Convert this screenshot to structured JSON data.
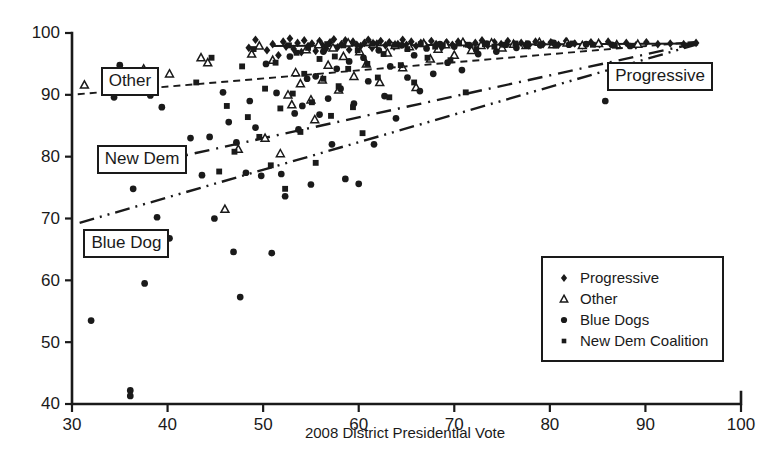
{
  "chart_data": {
    "type": "scatter",
    "title": "",
    "xlabel": "2008 District Presidential Vote",
    "ylabel": "",
    "xlim": [
      30,
      100
    ],
    "ylim": [
      40,
      100
    ],
    "xticks": [
      30,
      40,
      50,
      60,
      70,
      80,
      90,
      100
    ],
    "yticks": [
      40,
      50,
      60,
      70,
      80,
      90,
      100
    ],
    "grid": false,
    "legend_position": "lower-right",
    "series": [
      {
        "name": "Progressive",
        "marker": "diamond",
        "points": [
          [
            48.5,
            97.6
          ],
          [
            49.2,
            98.9
          ],
          [
            50.4,
            97.2
          ],
          [
            51.0,
            98.2
          ],
          [
            51.6,
            96.4
          ],
          [
            52.1,
            98.6
          ],
          [
            52.4,
            97.8
          ],
          [
            52.8,
            99.1
          ],
          [
            53.2,
            97.4
          ],
          [
            53.6,
            98.4
          ],
          [
            54.0,
            96.9
          ],
          [
            54.3,
            98.8
          ],
          [
            54.7,
            97.9
          ],
          [
            55.1,
            98.3
          ],
          [
            55.5,
            97.1
          ],
          [
            55.9,
            98.7
          ],
          [
            56.2,
            98.0
          ],
          [
            56.6,
            97.5
          ],
          [
            57.0,
            98.5
          ],
          [
            57.4,
            99.0
          ],
          [
            57.8,
            97.7
          ],
          [
            58.2,
            98.2
          ],
          [
            58.6,
            98.8
          ],
          [
            59.0,
            97.3
          ],
          [
            59.4,
            98.6
          ],
          [
            59.8,
            98.1
          ],
          [
            60.2,
            97.9
          ],
          [
            60.6,
            98.4
          ],
          [
            61.0,
            98.9
          ],
          [
            61.4,
            97.6
          ],
          [
            61.9,
            98.3
          ],
          [
            62.3,
            98.7
          ],
          [
            62.8,
            98.0
          ],
          [
            63.2,
            98.5
          ],
          [
            63.7,
            97.8
          ],
          [
            64.1,
            98.2
          ],
          [
            64.6,
            98.9
          ],
          [
            65.0,
            98.1
          ],
          [
            65.5,
            98.6
          ],
          [
            66.0,
            97.9
          ],
          [
            66.5,
            98.4
          ],
          [
            67.0,
            98.0
          ],
          [
            67.6,
            98.7
          ],
          [
            68.1,
            98.2
          ],
          [
            68.7,
            97.7
          ],
          [
            69.2,
            98.5
          ],
          [
            69.8,
            98.1
          ],
          [
            70.4,
            98.6
          ],
          [
            71.0,
            98.3
          ],
          [
            71.6,
            97.9
          ],
          [
            72.2,
            98.4
          ],
          [
            72.9,
            98.8
          ],
          [
            73.5,
            98.0
          ],
          [
            74.2,
            98.5
          ],
          [
            74.9,
            98.2
          ],
          [
            75.6,
            98.7
          ],
          [
            76.3,
            98.1
          ],
          [
            77.0,
            98.4
          ],
          [
            77.8,
            98.0
          ],
          [
            78.5,
            98.6
          ],
          [
            79.3,
            98.2
          ],
          [
            80.1,
            98.5
          ],
          [
            80.9,
            98.1
          ],
          [
            81.7,
            98.7
          ],
          [
            82.6,
            98.3
          ],
          [
            83.4,
            98.0
          ],
          [
            84.3,
            98.5
          ],
          [
            85.2,
            98.2
          ],
          [
            86.1,
            98.6
          ],
          [
            87.0,
            98.1
          ],
          [
            88.0,
            98.4
          ],
          [
            89.0,
            98.0
          ],
          [
            90.1,
            98.5
          ],
          [
            91.3,
            98.2
          ],
          [
            92.6,
            98.3
          ],
          [
            94.0,
            98.2
          ],
          [
            95.3,
            98.4
          ]
        ]
      },
      {
        "name": "Other",
        "marker": "triangle-open",
        "points": [
          [
            31.3,
            91.6
          ],
          [
            37.5,
            94.2
          ],
          [
            40.2,
            93.4
          ],
          [
            43.5,
            96.0
          ],
          [
            44.2,
            95.2
          ],
          [
            46.0,
            71.5
          ],
          [
            47.4,
            81.2
          ],
          [
            48.8,
            96.6
          ],
          [
            49.6,
            97.9
          ],
          [
            50.2,
            83.0
          ],
          [
            51.0,
            95.6
          ],
          [
            51.8,
            80.5
          ],
          [
            52.6,
            90.0
          ],
          [
            53.0,
            88.4
          ],
          [
            53.4,
            93.6
          ],
          [
            53.9,
            91.8
          ],
          [
            54.5,
            97.3
          ],
          [
            55.0,
            89.2
          ],
          [
            55.4,
            86.0
          ],
          [
            55.8,
            98.1
          ],
          [
            56.2,
            92.4
          ],
          [
            56.8,
            94.8
          ],
          [
            57.3,
            97.6
          ],
          [
            57.9,
            90.8
          ],
          [
            58.4,
            96.2
          ],
          [
            58.9,
            98.4
          ],
          [
            59.5,
            93.0
          ],
          [
            60.1,
            97.0
          ],
          [
            60.8,
            95.0
          ],
          [
            61.5,
            98.2
          ],
          [
            62.2,
            92.0
          ],
          [
            63.0,
            96.8
          ],
          [
            63.8,
            98.0
          ],
          [
            64.6,
            94.4
          ],
          [
            65.3,
            97.8
          ],
          [
            66.0,
            91.2
          ],
          [
            66.8,
            98.3
          ],
          [
            67.5,
            95.8
          ],
          [
            68.3,
            97.4
          ],
          [
            69.1,
            98.1
          ],
          [
            70.0,
            96.4
          ],
          [
            70.9,
            98.5
          ],
          [
            71.8,
            97.2
          ],
          [
            72.8,
            98.0
          ],
          [
            73.9,
            98.4
          ],
          [
            75.0,
            97.6
          ],
          [
            76.2,
            98.2
          ],
          [
            77.5,
            98.0
          ],
          [
            78.9,
            98.5
          ],
          [
            80.3,
            98.1
          ],
          [
            81.8,
            98.4
          ],
          [
            83.4,
            98.0
          ],
          [
            85.1,
            98.3
          ],
          [
            87.0,
            98.1
          ],
          [
            89.2,
            98.2
          ]
        ]
      },
      {
        "name": "Blue Dogs",
        "marker": "circle",
        "points": [
          [
            32.0,
            53.5
          ],
          [
            34.4,
            89.6
          ],
          [
            35.0,
            94.8
          ],
          [
            36.1,
            42.2
          ],
          [
            36.1,
            41.3
          ],
          [
            36.4,
            74.8
          ],
          [
            37.6,
            59.5
          ],
          [
            38.2,
            89.9
          ],
          [
            38.9,
            70.2
          ],
          [
            39.4,
            88.0
          ],
          [
            40.2,
            66.8
          ],
          [
            42.4,
            83.0
          ],
          [
            43.6,
            77.0
          ],
          [
            44.4,
            83.2
          ],
          [
            44.9,
            70.0
          ],
          [
            45.8,
            90.4
          ],
          [
            46.4,
            85.6
          ],
          [
            46.9,
            64.6
          ],
          [
            47.2,
            82.3
          ],
          [
            47.6,
            57.3
          ],
          [
            48.2,
            77.4
          ],
          [
            48.6,
            89.0
          ],
          [
            49.2,
            84.7
          ],
          [
            49.8,
            76.9
          ],
          [
            50.3,
            95.0
          ],
          [
            50.9,
            64.4
          ],
          [
            51.4,
            90.3
          ],
          [
            51.9,
            77.2
          ],
          [
            52.3,
            73.6
          ],
          [
            52.8,
            96.2
          ],
          [
            53.3,
            87.0
          ],
          [
            53.7,
            84.4
          ],
          [
            54.1,
            88.2
          ],
          [
            54.6,
            92.6
          ],
          [
            55.0,
            75.5
          ],
          [
            55.5,
            93.0
          ],
          [
            55.9,
            86.8
          ],
          [
            56.3,
            97.0
          ],
          [
            56.8,
            89.4
          ],
          [
            57.2,
            82.0
          ],
          [
            57.7,
            94.2
          ],
          [
            58.1,
            91.0
          ],
          [
            58.6,
            76.4
          ],
          [
            59.0,
            95.4
          ],
          [
            59.5,
            88.6
          ],
          [
            60.0,
            75.6
          ],
          [
            60.5,
            96.0
          ],
          [
            61.0,
            92.2
          ],
          [
            61.6,
            82.0
          ],
          [
            62.1,
            97.2
          ],
          [
            62.7,
            89.8
          ],
          [
            63.3,
            94.6
          ],
          [
            63.9,
            86.2
          ],
          [
            64.5,
            98.0
          ],
          [
            65.1,
            92.8
          ],
          [
            65.8,
            96.4
          ],
          [
            66.4,
            90.6
          ],
          [
            67.1,
            97.5
          ],
          [
            67.8,
            93.4
          ],
          [
            68.5,
            98.2
          ],
          [
            69.3,
            95.2
          ],
          [
            70.0,
            97.8
          ],
          [
            70.8,
            94.0
          ],
          [
            71.6,
            98.0
          ],
          [
            72.5,
            96.6
          ],
          [
            73.4,
            98.3
          ],
          [
            74.4,
            97.0
          ],
          [
            75.4,
            98.1
          ],
          [
            76.5,
            97.6
          ],
          [
            77.7,
            98.3
          ],
          [
            79.0,
            98.0
          ],
          [
            80.4,
            98.4
          ],
          [
            82.0,
            98.1
          ],
          [
            83.8,
            98.2
          ],
          [
            85.8,
            89.0
          ],
          [
            86.5,
            98.1
          ],
          [
            88.4,
            97.9
          ]
        ]
      },
      {
        "name": "New Dem Coalition",
        "marker": "square",
        "points": [
          [
            43.0,
            92.0
          ],
          [
            44.6,
            96.0
          ],
          [
            45.4,
            77.6
          ],
          [
            46.2,
            88.2
          ],
          [
            47.0,
            80.8
          ],
          [
            47.8,
            94.6
          ],
          [
            48.4,
            86.4
          ],
          [
            49.0,
            97.4
          ],
          [
            49.6,
            83.2
          ],
          [
            50.2,
            91.0
          ],
          [
            50.8,
            78.6
          ],
          [
            51.3,
            95.2
          ],
          [
            51.8,
            87.8
          ],
          [
            52.3,
            74.8
          ],
          [
            52.7,
            98.0
          ],
          [
            53.1,
            90.2
          ],
          [
            53.5,
            96.8
          ],
          [
            53.9,
            84.0
          ],
          [
            54.3,
            93.4
          ],
          [
            54.7,
            97.6
          ],
          [
            55.1,
            88.8
          ],
          [
            55.5,
            79.0
          ],
          [
            55.9,
            95.8
          ],
          [
            56.3,
            92.6
          ],
          [
            56.7,
            98.2
          ],
          [
            57.1,
            86.6
          ],
          [
            57.5,
            96.2
          ],
          [
            57.9,
            91.4
          ],
          [
            58.4,
            98.0
          ],
          [
            58.9,
            94.2
          ],
          [
            59.4,
            88.0
          ],
          [
            59.9,
            97.2
          ],
          [
            60.4,
            83.8
          ],
          [
            60.9,
            95.0
          ],
          [
            61.4,
            98.3
          ],
          [
            62.0,
            92.8
          ],
          [
            62.6,
            96.6
          ],
          [
            63.2,
            89.6
          ],
          [
            63.8,
            98.1
          ],
          [
            64.4,
            94.8
          ],
          [
            65.1,
            97.4
          ],
          [
            65.8,
            92.0
          ],
          [
            66.5,
            98.2
          ],
          [
            67.2,
            96.0
          ],
          [
            68.0,
            97.8
          ],
          [
            68.8,
            98.0
          ],
          [
            69.6,
            95.6
          ],
          [
            70.5,
            98.3
          ],
          [
            71.2,
            90.4
          ],
          [
            71.4,
            98.1
          ],
          [
            72.3,
            97.4
          ],
          [
            73.2,
            98.2
          ],
          [
            74.2,
            97.8
          ],
          [
            75.2,
            98.1
          ],
          [
            76.4,
            98.3
          ],
          [
            77.6,
            98.0
          ],
          [
            79.0,
            98.2
          ],
          [
            80.6,
            98.0
          ],
          [
            82.4,
            98.3
          ],
          [
            84.5,
            98.1
          ],
          [
            86.8,
            98.0
          ]
        ]
      }
    ],
    "trendlines": [
      {
        "name": "Progressive",
        "style": "solid",
        "x0": 51.0,
        "y0": 97.9,
        "x1": 95.5,
        "y1": 98.3
      },
      {
        "name": "Other",
        "style": "dashed",
        "x0": 30.6,
        "y0": 90.1,
        "x1": 95.5,
        "y1": 98.6
      },
      {
        "name": "New Dem",
        "style": "dash-dot",
        "x0": 36.5,
        "y0": 78.4,
        "x1": 95.5,
        "y1": 98.4
      },
      {
        "name": "Blue Dog",
        "style": "dash-dot-dot",
        "x0": 30.8,
        "y0": 69.3,
        "x1": 95.5,
        "y1": 98.2
      }
    ],
    "annotations": [
      {
        "label": "Other",
        "x": 33.0,
        "y": 92.6
      },
      {
        "label": "New Dem",
        "x": 32.6,
        "y": 80.0
      },
      {
        "label": "Blue Dog",
        "x": 31.2,
        "y": 66.4
      },
      {
        "label": "Progressive",
        "x": 86.0,
        "y": 93.4
      }
    ],
    "legend_entries": [
      {
        "label": "Progressive",
        "marker": "diamond"
      },
      {
        "label": "Other",
        "marker": "triangle-open"
      },
      {
        "label": "Blue Dogs",
        "marker": "circle"
      },
      {
        "label": "New Dem Coalition",
        "marker": "square"
      }
    ],
    "colors": {
      "ink": "#1a1a1a",
      "background": "#ffffff"
    }
  }
}
